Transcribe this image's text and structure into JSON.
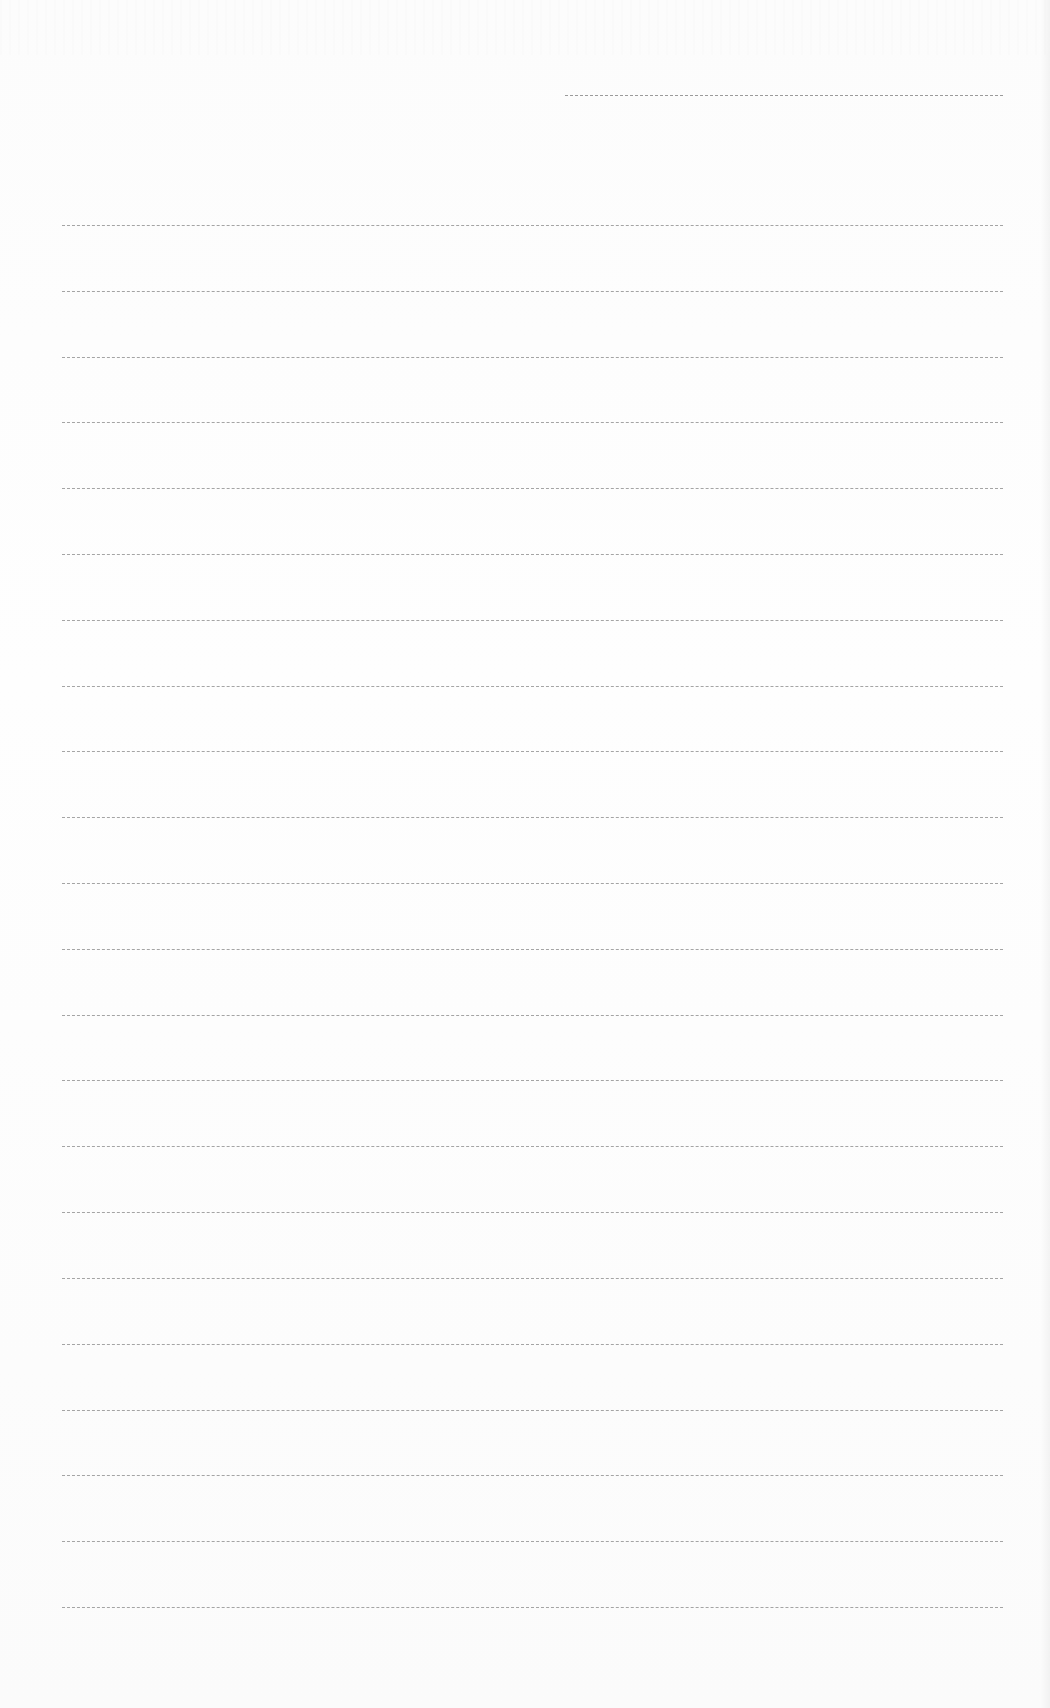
{
  "document": {
    "type": "blank ruled form",
    "header_line": {
      "x": 565,
      "y": 95,
      "width": 438
    },
    "rules": {
      "count": 22,
      "x": 62,
      "width": 941,
      "y_positions": [
        225,
        291,
        357,
        422,
        488,
        554,
        620,
        686,
        751,
        817,
        883,
        949,
        1015,
        1080,
        1146,
        1212,
        1278,
        1344,
        1410,
        1475,
        1541,
        1607
      ]
    },
    "line_color": "#8f8f8f",
    "background_color": "#fdfdfd"
  }
}
